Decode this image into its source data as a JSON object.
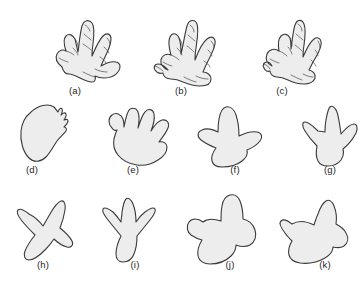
{
  "figure": {
    "kind": "scientific-plate",
    "background_color": "#ffffff",
    "rows": 3,
    "panel_count": 11
  },
  "style": {
    "fill_color": "#ededed",
    "outline_color": "#3a3a3a",
    "detail_color": "#4a4a4a",
    "label_color": "#262626",
    "outline_width": 1.1,
    "detail_width": 0.7,
    "label_font_size": "9.5px"
  },
  "panels": [
    {
      "id": "a",
      "label": "(a)",
      "row": 1,
      "description": "clawed five-toed print with segmented toe pads",
      "toe_count": 5,
      "has_claws": true,
      "has_pad_segments": true,
      "label_x": 75,
      "label_y": 94,
      "outline": "M 62 67 C 57 63 55 58 57 54 C 59 50 63 49 66 51 C 64 45 63 39 66 36 C 69 33 73 35 75 39 C 76 43 77 48 78 52 C 79 45 80 33 82 26 C 84 20 89 19 92 23 C 95 27 94 36 93 44 C 92 49 92 53 92 56 C 95 49 99 40 103 36 C 107 32 111 34 111 39 C 111 44 108 51 105 57 C 103 61 102 64 101 66 C 106 63 112 61 116 62 C 121 63 121 68 118 72 C 115 76 109 78 104 78 C 100 78 97 77 95 76 C 96 79 95 82 92 82 C 88 82 84 80 80 78 C 76 76 72 74 69 74 C 65 74 63 71 62 67 Z",
      "details": [
        "M 66 51 C 69 52 72 53 74 55",
        "M 59 58 C 62 60 65 61 68 62",
        "M 75 39 C 77 41 78 44 78 47",
        "M 73 48 C 75 50 77 52 78 55",
        "M 85 25 C 87 26 89 28 90 31",
        "M 84 34 C 86 36 89 38 91 40",
        "M 83 44 C 86 46 89 48 91 50",
        "M 107 38 C 109 40 110 42 110 45",
        "M 104 47 C 106 49 108 51 109 53",
        "M 100 57 C 103 59 105 61 106 63",
        "M 95 69 C 99 71 103 72 107 72",
        "M 83 72 C 87 74 91 76 95 77"
      ]
    },
    {
      "id": "b",
      "label": "(b)",
      "row": 1,
      "description": "clawed four-toed print with offset hallux and segmented pads",
      "toe_count": 4,
      "has_claws": true,
      "has_pad_segments": true,
      "label_x": 181,
      "label_y": 94,
      "outline": "M 168 70 C 163 68 160 64 161 60 C 162 55 167 53 171 55 C 169 48 168 41 170 37 C 172 32 177 33 179 38 C 181 43 181 49 181 54 C 183 46 185 33 187 26 C 189 19 195 19 197 24 C 199 30 197 40 196 48 C 195 53 195 57 195 60 C 198 52 203 42 207 39 C 212 35 216 38 215 44 C 214 50 210 57 207 63 C 205 67 204 70 203 72 C 207 72 211 75 211 79 C 211 84 206 86 200 86 C 194 86 188 84 183 82 C 179 80 175 79 171 79 C 166 79 163 76 163 73 C 160 74 157 73 155 70 C 153 67 155 64 158 64 C 161 64 164 66 166 68 Z",
      "details": [
        "M 171 55 C 174 56 177 58 179 60",
        "M 163 62 C 166 64 169 65 172 66",
        "M 179 38 C 181 40 182 43 182 46",
        "M 177 48 C 179 50 181 52 182 55",
        "M 190 25 C 192 26 194 29 194 32",
        "M 188 35 C 190 37 193 39 195 41",
        "M 187 46 C 190 48 192 50 194 52",
        "M 211 41 C 213 43 214 45 214 48",
        "M 208 50 C 210 52 212 54 212 56",
        "M 204 61 C 207 63 209 65 210 67",
        "M 196 76 C 200 78 204 79 208 79",
        "M 184 77 C 188 79 192 81 196 82",
        "M 155 66 C 158 67 161 69 163 71"
      ]
    },
    {
      "id": "c",
      "label": "(c)",
      "row": 1,
      "description": "narrow clawed print with short splayed toes and side digit",
      "toe_count": 4,
      "has_claws": true,
      "has_pad_segments": true,
      "label_x": 282,
      "label_y": 94,
      "outline": "M 272 66 C 267 64 265 59 267 54 C 269 49 275 48 279 51 C 278 45 278 39 281 36 C 284 33 288 34 290 38 C 291 41 291 45 291 49 C 292 42 293 31 295 25 C 297 19 302 19 304 24 C 306 29 305 38 304 45 C 303 50 303 54 303 57 C 306 50 310 42 314 39 C 318 36 322 39 321 45 C 320 51 316 57 313 62 C 311 66 310 68 309 70 C 313 71 316 74 315 78 C 314 82 309 84 304 84 C 298 84 292 82 288 80 C 284 78 280 77 277 77 C 273 77 270 74 270 71 C 268 72 265 71 264 68 C 262 65 264 62 267 62 C 269 62 271 64 272 66 Z",
      "details": [
        "M 279 51 C 282 52 285 54 287 56",
        "M 270 59 C 273 61 276 62 279 63",
        "M 290 38 C 291 40 292 43 292 46",
        "M 288 47 C 290 49 291 51 292 54",
        "M 298 24 C 300 25 302 28 302 31",
        "M 296 34 C 298 36 301 38 303 40",
        "M 295 45 C 298 47 300 49 302 51",
        "M 318 41 C 319 43 320 45 320 48",
        "M 315 50 C 317 52 318 54 318 56",
        "M 311 60 C 313 62 315 64 316 66",
        "M 303 74 C 307 76 310 77 313 77",
        "M 291 75 C 295 77 299 79 302 80",
        "M 264 64 C 267 65 269 67 270 69"
      ]
    },
    {
      "id": "d",
      "label": "(d)",
      "row": 2,
      "description": "oval pad print with small notched claw marks on one edge",
      "toe_count": 0,
      "has_claws": true,
      "has_pad_segments": false,
      "label_x": 32,
      "label_y": 173,
      "outline": "M 30 113 C 38 105 48 103 54 107 C 56 109 57 111 58 112 C 59 109 61 107 62 109 C 63 111 62 113 61 115 C 63 113 65 112 66 114 C 67 116 65 118 64 120 C 66 119 68 119 68 121 C 68 123 66 125 64 127 C 66 127 67 129 66 131 C 64 134 60 137 57 141 C 53 147 50 153 46 157 C 41 162 34 163 29 158 C 23 152 20 141 21 131 C 22 123 25 117 30 113 Z",
      "details": []
    },
    {
      "id": "e",
      "label": "(e)",
      "row": 2,
      "description": "hand-like print with five rounded lobed digits",
      "toe_count": 5,
      "has_claws": false,
      "has_pad_segments": false,
      "label_x": 133,
      "label_y": 173,
      "outline": "M 112 128 C 108 124 108 118 112 115 C 116 112 121 114 123 119 C 124 122 124 125 124 127 C 125 122 126 116 128 112 C 130 107 136 107 138 112 C 140 117 139 123 138 128 C 140 122 142 115 145 112 C 148 108 153 109 154 114 C 155 119 153 126 151 131 C 154 126 158 121 162 120 C 167 119 170 123 168 128 C 166 133 162 138 159 142 C 163 141 167 143 167 147 C 167 152 163 157 158 160 C 152 164 144 166 137 165 C 129 164 122 160 118 155 C 114 150 113 144 114 139 C 115 135 116 132 117 130 C 115 131 113 130 112 128 Z",
      "details": []
    },
    {
      "id": "f",
      "label": "(f)",
      "row": 2,
      "description": "three-toed bird-like print with broad rounded central toe",
      "toe_count": 3,
      "has_claws": false,
      "has_pad_segments": false,
      "label_x": 235,
      "label_y": 173,
      "outline": "M 218 132 C 212 129 206 128 202 130 C 197 132 197 137 201 140 C 205 143 211 146 216 148 C 213 152 211 157 212 161 C 213 165 217 167 222 167 C 229 167 237 165 242 161 C 246 158 248 154 247 150 C 252 148 257 145 260 141 C 263 137 262 133 257 132 C 252 131 245 133 239 136 C 239 129 238 121 236 115 C 234 109 230 106 226 107 C 222 108 220 113 219 119 C 218 124 218 129 218 132 Z",
      "details": []
    },
    {
      "id": "g",
      "label": "(g)",
      "row": 2,
      "description": "three-toed print with slender pointed toes and narrow heel",
      "toe_count": 3,
      "has_claws": false,
      "has_pad_segments": false,
      "label_x": 330,
      "label_y": 173,
      "outline": "M 318 131 C 313 126 308 122 305 122 C 302 122 302 126 305 131 C 308 136 313 142 317 146 C 316 151 316 157 318 161 C 320 165 324 166 328 166 C 333 166 338 164 341 160 C 343 157 344 153 343 149 C 348 145 353 139 356 133 C 358 128 357 124 354 124 C 351 124 346 128 341 134 C 340 127 339 118 337 112 C 335 107 332 105 330 107 C 328 109 327 114 326 120 C 325 125 325 129 325 132 Z",
      "details": []
    },
    {
      "id": "h",
      "label": "(h)",
      "row": 3,
      "description": "asymmetric three-toed print with sharp claw tips",
      "toe_count": 3,
      "has_claws": true,
      "has_pad_segments": false,
      "label_x": 43,
      "label_y": 268,
      "outline": "M 29 214 C 24 210 20 208 18 210 C 16 212 18 216 22 221 C 26 226 31 231 35 235 C 31 240 27 246 25 251 C 23 256 25 260 29 260 C 33 260 39 256 45 250 C 49 246 52 242 54 239 C 58 243 63 246 67 247 C 71 248 74 245 72 241 C 70 237 65 232 60 228 C 62 223 64 216 65 210 C 66 204 64 200 61 201 C 58 202 54 207 50 214 C 47 219 45 223 43 226 C 40 222 35 217 29 214 Z",
      "details": []
    },
    {
      "id": "i",
      "label": "(i)",
      "row": 3,
      "description": "symmetrical three-toed print with deep notches between toes",
      "toe_count": 3,
      "has_claws": true,
      "has_pad_segments": false,
      "label_x": 135,
      "label_y": 268,
      "outline": "M 113 212 C 108 208 104 207 103 209 C 102 211 104 215 108 220 C 112 225 117 231 121 236 C 118 242 116 249 116 254 C 116 259 119 262 123 262 C 128 262 132 259 134 254 C 136 249 137 242 137 236 C 141 231 146 225 150 220 C 154 215 156 211 155 209 C 154 207 150 208 145 212 C 141 215 138 219 136 222 C 136 216 135 209 133 204 C 131 199 128 197 126 199 C 124 201 123 206 122 212 C 122 216 121 219 121 222 C 119 219 116 215 113 212 Z",
      "details": []
    },
    {
      "id": "j",
      "label": "(j)",
      "row": 3,
      "description": "three-toed print with broad rounded lobes and wide heel",
      "toe_count": 3,
      "has_claws": false,
      "has_pad_segments": false,
      "label_x": 230,
      "label_y": 268,
      "outline": "M 203 222 C 198 218 192 218 189 222 C 186 226 187 232 191 235 C 194 237 198 239 202 240 C 199 245 197 251 198 256 C 199 261 204 264 210 264 C 218 264 226 261 231 256 C 234 253 236 249 236 245 C 241 247 246 247 250 245 C 255 242 257 236 255 230 C 253 224 248 220 243 219 C 243 213 242 206 240 201 C 238 196 234 194 230 195 C 226 196 223 200 222 206 C 221 211 221 217 221 221 C 215 219 208 218 203 222 Z",
      "details": []
    },
    {
      "id": "k",
      "label": "(k)",
      "row": 3,
      "description": "broad webbed-looking print with two v-notches and rounded heel",
      "toe_count": 3,
      "has_claws": false,
      "has_pad_segments": false,
      "label_x": 325,
      "label_y": 268,
      "outline": "M 292 224 C 287 220 283 219 281 221 C 279 223 281 228 285 233 C 287 236 290 239 292 241 C 289 246 288 251 289 255 C 290 259 294 262 300 263 C 308 264 318 262 325 258 C 330 255 333 251 333 247 C 337 248 341 248 344 246 C 348 243 349 238 346 233 C 344 229 340 226 336 224 C 337 218 336 211 334 206 C 332 201 329 199 326 201 C 323 203 320 208 318 214 C 316 218 315 222 314 225 C 308 222 299 220 292 224 Z",
      "details": []
    }
  ]
}
